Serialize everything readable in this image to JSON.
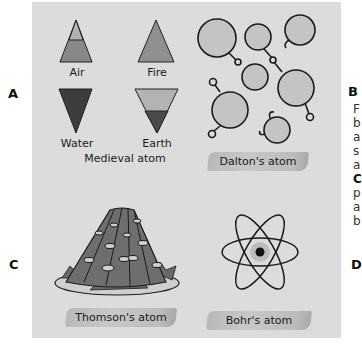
{
  "panel_labels": {
    "a": "A",
    "b": "B",
    "c": "C",
    "d": "D"
  },
  "medieval": {
    "caption": "Medieval atom",
    "elements": [
      {
        "name": "Air",
        "shape": "triangle-up",
        "colors": [
          "#b3b3b3",
          "#888888"
        ]
      },
      {
        "name": "Fire",
        "shape": "triangle-up",
        "colors": [
          "#8f8f8f"
        ]
      },
      {
        "name": "Water",
        "shape": "triangle-down",
        "colors": [
          "#3d3d3d"
        ]
      },
      {
        "name": "Earth",
        "shape": "triangle-down",
        "colors": [
          "#b3b3b3",
          "#4a4a4a"
        ]
      }
    ]
  },
  "dalton": {
    "caption": "Dalton's atom"
  },
  "thomson": {
    "caption": "Thomson's atom"
  },
  "bohr": {
    "caption": "Bohr's atom"
  },
  "side_text_fragments": {
    "b_lines": [
      "F",
      "b",
      "a",
      "s",
      "a"
    ],
    "c_heading": "C",
    "c_lines": [
      "p",
      "a",
      "b"
    ]
  },
  "colors": {
    "panel_bg": "#dcdcdc",
    "ink": "#1a1a1a"
  }
}
